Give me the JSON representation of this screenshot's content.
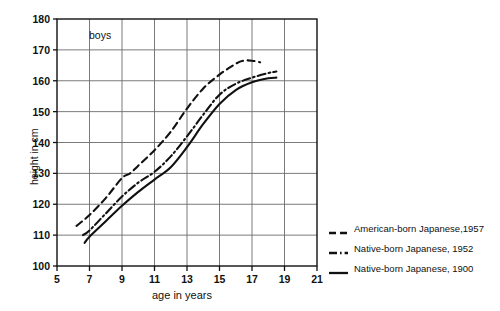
{
  "panel_note": "boys",
  "axis": {
    "x_title": "age in years",
    "y_title": "height in cm",
    "x_ticks": [
      "5",
      "7",
      "9",
      "11",
      "13",
      "15",
      "17",
      "19",
      "21"
    ],
    "y_ticks": [
      "100",
      "110",
      "120",
      "130",
      "140",
      "150",
      "160",
      "170",
      "180"
    ]
  },
  "legend": {
    "items": [
      {
        "label": "American-born Japanese,1957",
        "style": "dashed"
      },
      {
        "label": "Native-born Japanese, 1952",
        "style": "dash-dot"
      },
      {
        "label": "Native-born Japanese, 1900",
        "style": "solid"
      }
    ]
  },
  "colors": {
    "line": "#111111",
    "grid": "#6b6b6b",
    "axis": "#111111",
    "background": "#ffffff"
  },
  "chart_data": {
    "type": "line",
    "title": "",
    "subtitle": "",
    "annotations": [
      "boys"
    ],
    "xlabel": "age in years",
    "ylabel": "height in cm",
    "xlim": [
      5,
      21
    ],
    "ylim": [
      100,
      180
    ],
    "xticks": [
      5,
      7,
      9,
      11,
      13,
      15,
      17,
      19,
      21
    ],
    "yticks": [
      100,
      110,
      120,
      130,
      140,
      150,
      160,
      170,
      180
    ],
    "grid": true,
    "legend_position": "right-outside",
    "series": [
      {
        "name": "American-born Japanese,1957",
        "style": "dashed",
        "x": [
          6.2,
          7,
          8,
          9,
          9.5,
          10,
          11,
          12,
          13,
          14,
          15,
          16,
          16.5,
          17,
          17.5
        ],
        "y": [
          113.0,
          116.5,
          122.0,
          128.5,
          130.0,
          132.5,
          137.5,
          143.5,
          151.0,
          157.5,
          162.0,
          165.5,
          166.5,
          166.5,
          166.0
        ]
      },
      {
        "name": "Native-born Japanese, 1952",
        "style": "dash-dot",
        "x": [
          6.6,
          7,
          8,
          9,
          10,
          11,
          12,
          13,
          14,
          15,
          16,
          17,
          18,
          18.5
        ],
        "y": [
          110.0,
          111.5,
          117.0,
          122.5,
          127.0,
          130.5,
          135.5,
          142.0,
          149.0,
          155.5,
          159.0,
          161.0,
          162.5,
          163.0
        ]
      },
      {
        "name": "Native-born Japanese, 1900",
        "style": "solid",
        "x": [
          6.7,
          7,
          8,
          9,
          10,
          11,
          12,
          13,
          14,
          15,
          16,
          17,
          18,
          18.5
        ],
        "y": [
          107.5,
          109.5,
          114.5,
          119.5,
          124.0,
          128.0,
          132.0,
          138.5,
          146.0,
          152.5,
          157.0,
          159.5,
          160.8,
          161.0
        ]
      }
    ]
  }
}
